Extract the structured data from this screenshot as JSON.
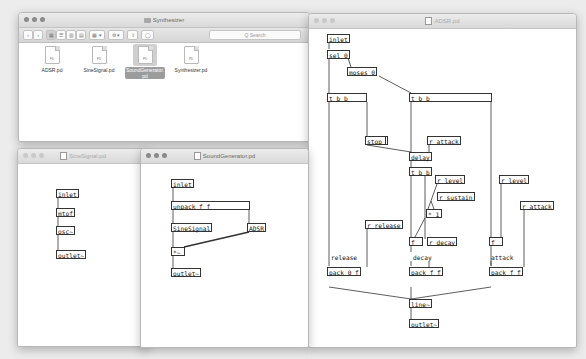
{
  "finder": {
    "title": "Synthesizer",
    "toolbar": {
      "back": "‹",
      "forward": "›",
      "view_icons": "▦",
      "view_list": "☰",
      "view_columns": "▥",
      "view_gallery": "▤",
      "arrange": "▦ ▾",
      "action": "⚙ ▾",
      "share": "⇪",
      "tags": "◯"
    },
    "search_placeholder": "Q Search",
    "files": [
      {
        "name": "ADSR.pd",
        "ext": "PD",
        "selected": false
      },
      {
        "name": "SineSignal.pd",
        "ext": "PD",
        "selected": false
      },
      {
        "name": "SoundGenerator.pd",
        "ext": "PD",
        "selected": true
      },
      {
        "name": "Synthesizer.pd",
        "ext": "PD",
        "selected": false
      }
    ],
    "selected_name_line1": "SoundGenerator.",
    "selected_name_line2": "pd"
  },
  "adsr": {
    "title": "ADSR.pd",
    "objects": {
      "inlet": "inlet",
      "sel": "sel 0",
      "moses": "moses 0",
      "tbb_left": "t b b",
      "tbb_right": "t b b",
      "stop": "stop",
      "r_attack1": "r attack",
      "delay": "delay",
      "tbb_mid": "t b b",
      "r_level1": "r level",
      "r_sustain": "r sustain",
      "mult": "* 1",
      "r_release": "r release",
      "f_decay": "f",
      "r_decay": "r decay",
      "r_level2": "r level",
      "r_attack2": "r attack",
      "f_attack": "f",
      "pack_release": "pack 0 f",
      "pack_decay": "pack f f",
      "pack_attack": "pack f f",
      "line": "line~",
      "outlet": "outlet~"
    },
    "comments": {
      "release": "release",
      "decay": "decay",
      "attack": "attack"
    }
  },
  "sine": {
    "title": "SineSignal.pd",
    "objects": {
      "inlet": "inlet",
      "mtof": "mtof",
      "osc": "osc~",
      "outlet": "outlet~"
    }
  },
  "soundgen": {
    "title": "SoundGenerator.pd",
    "objects": {
      "inlet": "inlet",
      "unpack": "unpack f f",
      "sine": "SineSignal",
      "adsr": "ADSR",
      "mult": "*~",
      "outlet": "outlet~"
    }
  }
}
